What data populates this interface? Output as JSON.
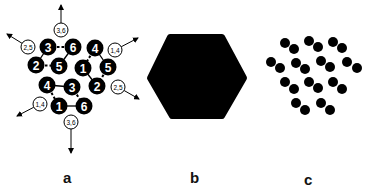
{
  "figure": {
    "panels": [
      {
        "label": "a",
        "description": "three six-membered rings of numbered nodes with outward dipole arrows",
        "label_pos": [
          68,
          182
        ],
        "rings": [
          {
            "nodes": [
              {
                "id": "3",
                "x": 48,
                "y": 47
              },
              {
                "id": "6",
                "x": 73,
                "y": 47
              },
              {
                "id": "2",
                "x": 36,
                "y": 65
              },
              {
                "id": "5",
                "x": 59,
                "y": 66
              }
            ],
            "solid_edges": [
              [
                "3",
                "2"
              ],
              [
                "6",
                "5"
              ]
            ],
            "dashed_edges": [
              [
                "3",
                "6"
              ],
              [
                "2",
                "5"
              ]
            ]
          },
          {
            "nodes": [
              {
                "id": "4",
                "x": 95,
                "y": 48
              },
              {
                "id": "1",
                "x": 83,
                "y": 68
              },
              {
                "id": "5",
                "x": 108,
                "y": 67
              },
              {
                "id": "2",
                "x": 97,
                "y": 86
              }
            ],
            "solid_edges": [
              [
                "4",
                "5"
              ],
              [
                "1",
                "2"
              ]
            ],
            "dashed_edges": [
              [
                "4",
                "1"
              ],
              [
                "5",
                "2"
              ]
            ]
          },
          {
            "nodes": [
              {
                "id": "4",
                "x": 47,
                "y": 85
              },
              {
                "id": "3",
                "x": 72,
                "y": 87
              },
              {
                "id": "1",
                "x": 59,
                "y": 106
              },
              {
                "id": "6",
                "x": 84,
                "y": 106
              }
            ],
            "solid_edges": [
              [
                "4",
                "3"
              ],
              [
                "1",
                "6"
              ]
            ],
            "dashed_edges": [
              [
                "4",
                "1"
              ],
              [
                "3",
                "6"
              ]
            ]
          }
        ],
        "vectors": [
          {
            "label": "3,6",
            "cx": 61,
            "cy": 30,
            "tip": [
              61,
              5
            ]
          },
          {
            "label": "2,5",
            "cx": 28,
            "cy": 47,
            "tip": [
              7,
              34
            ]
          },
          {
            "label": "1,4",
            "cx": 115,
            "cy": 50,
            "tip": [
              138,
              38
            ]
          },
          {
            "label": "2,5",
            "cx": 118,
            "cy": 87,
            "tip": [
              139,
              99
            ]
          },
          {
            "label": "1,4",
            "cx": 40,
            "cy": 104,
            "tip": [
              17,
              116
            ]
          },
          {
            "label": "3,6",
            "cx": 71,
            "cy": 122,
            "tip": [
              71,
              153
            ]
          }
        ]
      },
      {
        "label": "b",
        "description": "solid black rounded hexagon",
        "label_pos": [
          195,
          182
        ],
        "shape_points": "170,37 222,37 244,78 222,116 172,116 150,78"
      },
      {
        "label": "c",
        "description": "array of paired black dots (dimers)",
        "label_pos": [
          309,
          184
        ],
        "dimers": [
          [
            [
              285,
              43
            ],
            [
              294,
              49
            ]
          ],
          [
            [
              309,
              41
            ],
            [
              318,
              47
            ]
          ],
          [
            [
              333,
              42
            ],
            [
              342,
              48
            ]
          ],
          [
            [
              271,
              62
            ],
            [
              280,
              68
            ]
          ],
          [
            [
              296,
              63
            ],
            [
              305,
              69
            ]
          ],
          [
            [
              321,
              61
            ],
            [
              330,
              67
            ]
          ],
          [
            [
              347,
              62
            ],
            [
              357,
              68
            ]
          ],
          [
            [
              285,
              82
            ],
            [
              294,
              89
            ]
          ],
          [
            [
              309,
              82
            ],
            [
              318,
              88
            ]
          ],
          [
            [
              333,
              82
            ],
            [
              342,
              89
            ]
          ],
          [
            [
              296,
              103
            ],
            [
              305,
              110
            ]
          ],
          [
            [
              321,
              103
            ],
            [
              330,
              110
            ]
          ]
        ]
      }
    ],
    "colors": {
      "ink": "#000000",
      "background": "#ffffff",
      "node_text": "#ffffff"
    }
  }
}
